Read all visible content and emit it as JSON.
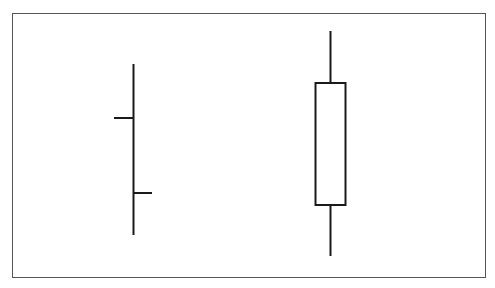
{
  "diagram": {
    "type": "price-bar-comparison",
    "colors": {
      "stroke": "#1a1a1a",
      "frame": "#555555",
      "background": "#ffffff"
    },
    "ohlc_bar": {
      "label": "",
      "high_y": 64,
      "low_y": 235,
      "open_y": 118,
      "close_y": 193
    },
    "candlestick": {
      "label": "",
      "high_y": 31,
      "body_top_y": 83,
      "body_bottom_y": 205,
      "low_y": 256,
      "filled": false
    }
  }
}
